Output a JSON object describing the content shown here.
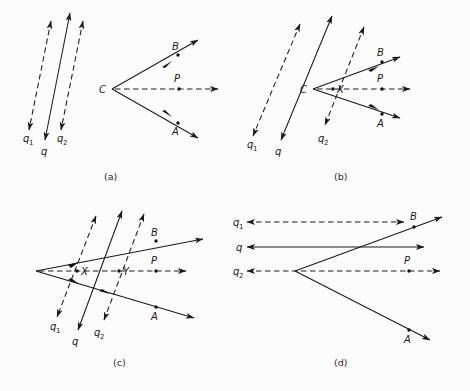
{
  "figure": {
    "background_color": "#fcfcfd",
    "stroke_color": "#1a1a1a",
    "width": 470,
    "height": 391
  },
  "panels": [
    {
      "id": "a",
      "caption": "(a)",
      "description": "Three parallel oblique double-headed arrows q1, q, q2 at left; separate angle vertex C at right with rays to B (upper), A (lower), and a dashed horizontal ray through P.",
      "labels": {
        "q1": "q",
        "q1_sub": "1",
        "q": "q",
        "q2": "q",
        "q2_sub": "2",
        "C": "C",
        "B": "B",
        "A": "A",
        "P": "P"
      },
      "lines": [
        {
          "name": "q1",
          "style": "dashed",
          "arrows": "both"
        },
        {
          "name": "q",
          "style": "solid",
          "arrows": "both"
        },
        {
          "name": "q2",
          "style": "dashed",
          "arrows": "both"
        },
        {
          "name": "CB",
          "style": "solid",
          "arrows": "end"
        },
        {
          "name": "CP",
          "style": "dashed",
          "arrows": "end"
        },
        {
          "name": "CA",
          "style": "solid",
          "arrows": "end"
        }
      ]
    },
    {
      "id": "b",
      "caption": "(b)",
      "description": "Parallel oblique arrows q1, q, q2 overlapping the angle; q passes through vertex C and q2 passes through point X on the dashed axis.",
      "labels": {
        "q1": "q",
        "q1_sub": "1",
        "q": "q",
        "q2": "q",
        "q2_sub": "2",
        "C": "C",
        "X": "X",
        "B": "B",
        "A": "A",
        "P": "P"
      },
      "lines": [
        {
          "name": "q1",
          "style": "dashed",
          "arrows": "both"
        },
        {
          "name": "q",
          "style": "solid",
          "arrows": "both"
        },
        {
          "name": "q2",
          "style": "dashed",
          "arrows": "both"
        },
        {
          "name": "CB",
          "style": "solid",
          "arrows": "end"
        },
        {
          "name": "CP",
          "style": "dashed",
          "arrows": "end"
        },
        {
          "name": "CA",
          "style": "solid",
          "arrows": "end"
        }
      ]
    },
    {
      "id": "c",
      "caption": "(c)",
      "description": "Angle vertex at far left with three parallel oblique arrows q1, q, q2 crossing the rays; q1 passes through X and q2 passes through Y on the dashed axis.",
      "labels": {
        "q1": "q",
        "q1_sub": "1",
        "q": "q",
        "q2": "q",
        "q2_sub": "2",
        "X": "X",
        "Y": "Y",
        "B": "B",
        "A": "A",
        "P": "P"
      },
      "lines": [
        {
          "name": "q1",
          "style": "dashed",
          "arrows": "both"
        },
        {
          "name": "q",
          "style": "solid",
          "arrows": "both"
        },
        {
          "name": "q2",
          "style": "dashed",
          "arrows": "both"
        },
        {
          "name": "vertexB",
          "style": "solid",
          "arrows": "end"
        },
        {
          "name": "vertexP",
          "style": "dashed",
          "arrows": "end"
        },
        {
          "name": "vertexA",
          "style": "solid",
          "arrows": "end"
        }
      ]
    },
    {
      "id": "d",
      "caption": "(d)",
      "description": "Three horizontal double-headed arrows q1, q, q2 aligned with the angle; q2 coincides with the dashed axis through the vertex and P, q1 passes through B level.",
      "labels": {
        "q1": "q",
        "q1_sub": "1",
        "q": "q",
        "q2": "q",
        "q2_sub": "2",
        "B": "B",
        "A": "A",
        "P": "P"
      },
      "lines": [
        {
          "name": "q1",
          "style": "dashed",
          "arrows": "both"
        },
        {
          "name": "q",
          "style": "solid",
          "arrows": "both"
        },
        {
          "name": "q2",
          "style": "dashed",
          "arrows": "both"
        },
        {
          "name": "vertexB",
          "style": "solid",
          "arrows": "end"
        },
        {
          "name": "vertexA",
          "style": "solid",
          "arrows": "end"
        }
      ]
    }
  ]
}
